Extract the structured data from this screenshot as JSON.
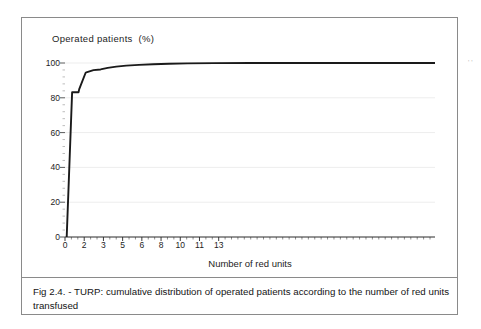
{
  "figure": {
    "caption": "Fig 2.4. - TURP: cumulative distribution of operated patients according to the number of red units transfused",
    "artifact_mark": "' '"
  },
  "chart_data": {
    "type": "line",
    "title": "Operated patients  (%)",
    "xlabel": "Number of red units",
    "ylabel": "",
    "xlim": [
      0,
      26
    ],
    "ylim": [
      0,
      100
    ],
    "grid": true,
    "grid_axis": "y",
    "legend": "none",
    "line_color": "#1a1a1a",
    "y_ticks": [
      0,
      20,
      40,
      60,
      80,
      100
    ],
    "y_tick_labels": [
      "0",
      "20",
      "40",
      "60",
      "80",
      "100"
    ],
    "x_tick_labels": [
      "0",
      "2",
      "3",
      "5",
      "6",
      "8",
      "10",
      "11",
      "13"
    ],
    "x_tick_label_positions": [
      0,
      1.35,
      2.7,
      4.05,
      5.4,
      6.75,
      8.1,
      9.45,
      10.8
    ],
    "x_minor_tick_step": 0.45,
    "series": [
      {
        "name": "Cumulative % of operated patients",
        "x": [
          0.12,
          0.5,
          0.95,
          1.0,
          1.45,
          1.5,
          2.0,
          2.5,
          3.0,
          3.6,
          4.3,
          5.2,
          6.2,
          7.3,
          8.6,
          10.5,
          13.0,
          16.5,
          21.0,
          26.0
        ],
        "y": [
          0,
          83.2,
          83.2,
          85.0,
          94.4,
          94.6,
          95.9,
          96.3,
          97.2,
          97.9,
          98.5,
          98.9,
          99.3,
          99.6,
          99.8,
          99.9,
          100,
          100,
          100,
          100
        ]
      }
    ]
  }
}
